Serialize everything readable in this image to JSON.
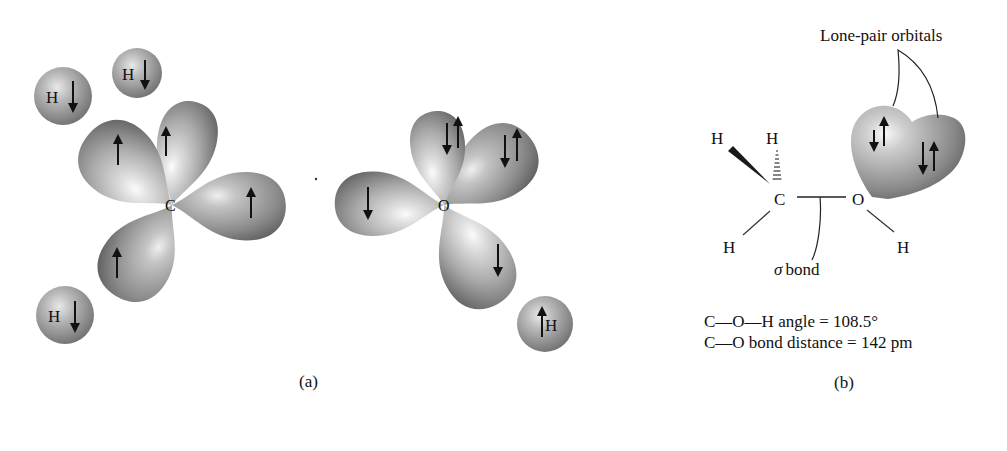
{
  "panel_a": {
    "caption": "(a)",
    "carbon_label": "C",
    "oxygen_label": "O",
    "hydrogen_label": "H",
    "carbon_orbitals": [
      {
        "name": "upper-left-lobe",
        "spin": "up"
      },
      {
        "name": "upper-back-lobe",
        "spin": "up"
      },
      {
        "name": "right-lobe",
        "spin": "up"
      },
      {
        "name": "lower-left-lobe",
        "spin": "up"
      }
    ],
    "oxygen_orbitals": [
      {
        "name": "lone-pair-lobe-1",
        "spin": "down-up"
      },
      {
        "name": "lone-pair-lobe-2",
        "spin": "down-up"
      },
      {
        "name": "left-lobe",
        "spin": "down"
      },
      {
        "name": "lower-right-lobe",
        "spin": "down"
      }
    ],
    "hydrogens": [
      {
        "position": "top-left",
        "spin": "down"
      },
      {
        "position": "top",
        "spin": "down"
      },
      {
        "position": "bottom-left",
        "spin": "down"
      },
      {
        "position": "bottom-right",
        "spin": "up"
      }
    ]
  },
  "panel_b": {
    "caption": "(b)",
    "lone_pair_label": "Lone-pair orbitals",
    "sigma_symbol": "σ",
    "sigma_label": "bond",
    "atoms": {
      "C": "C",
      "O": "O",
      "H": "H"
    },
    "angle_line": "C—O—H angle = 108.5°",
    "distance_line": "C—O bond distance = 142 pm"
  },
  "colors": {
    "lobe_light": "#f4f4f4",
    "lobe_mid": "#a8a8a8",
    "lobe_dark": "#5e5e5e",
    "ink": "#111111"
  }
}
